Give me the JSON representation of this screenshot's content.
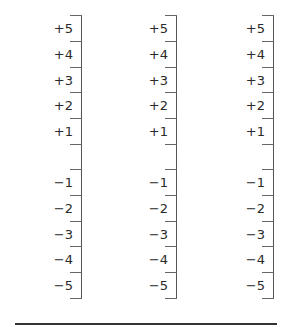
{
  "scales": [
    {
      "name_lines": [
        "Reliable",
        "data"
      ],
      "positive": [
        "+5",
        "+4",
        "+3",
        "+2",
        "+1"
      ],
      "negative": [
        "−1",
        "−2",
        "−3",
        "−4",
        "−5"
      ]
    },
    {
      "name_lines": [
        "Good",
        "staff"
      ],
      "positive": [
        "+5",
        "+4",
        "+3",
        "+2",
        "+1"
      ],
      "negative": [
        "−1",
        "−2",
        "−3",
        "−4",
        "−5"
      ]
    },
    {
      "name_lines": [
        "Reasonable",
        "price"
      ],
      "positive": [
        "+5",
        "+4",
        "+3",
        "+2",
        "+1"
      ],
      "negative": [
        "−1",
        "−2",
        "−3",
        "−4",
        "−5"
      ]
    }
  ]
}
